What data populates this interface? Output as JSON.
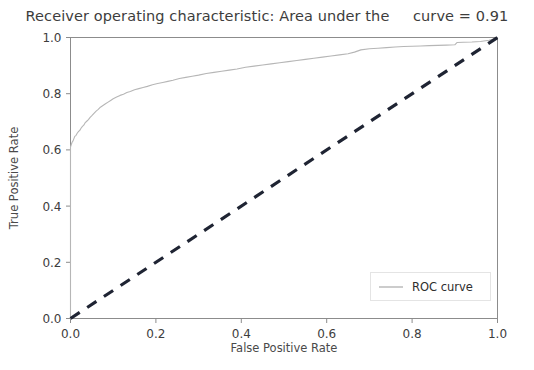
{
  "chart_data": {
    "type": "line",
    "title": "Receiver operating characteristic: Area under the     curve = 0.91",
    "title_main": "Receiver operating characteristic: Area under the",
    "title_auc_text": "curve = 0.91",
    "auc": 0.91,
    "xlabel": "False Positive Rate",
    "ylabel": "True Positive Rate",
    "xlim": [
      0.0,
      1.0
    ],
    "ylim": [
      0.0,
      1.0
    ],
    "grid": false,
    "legend_position": "lower right",
    "xticks": [
      "0.0",
      "0.2",
      "0.4",
      "0.6",
      "0.8",
      "1.0"
    ],
    "xtick_values": [
      0.0,
      0.2,
      0.4,
      0.6,
      0.8,
      1.0
    ],
    "yticks": [
      "0.0",
      "0.2",
      "0.4",
      "0.6",
      "0.8",
      "1.0"
    ],
    "ytick_values": [
      0.0,
      0.2,
      0.4,
      0.6,
      0.8,
      1.0
    ],
    "series": [
      {
        "name": "ROC curve",
        "style": "solid",
        "color": "#b6b6b6",
        "linewidth": 1.1,
        "x": [
          0.0,
          0.0,
          0.002,
          0.004,
          0.006,
          0.008,
          0.01,
          0.013,
          0.016,
          0.019,
          0.022,
          0.025,
          0.028,
          0.031,
          0.034,
          0.038,
          0.042,
          0.046,
          0.05,
          0.055,
          0.06,
          0.065,
          0.07,
          0.076,
          0.082,
          0.088,
          0.094,
          0.1,
          0.108,
          0.116,
          0.124,
          0.132,
          0.14,
          0.15,
          0.16,
          0.17,
          0.18,
          0.192,
          0.204,
          0.216,
          0.228,
          0.24,
          0.255,
          0.27,
          0.285,
          0.3,
          0.318,
          0.336,
          0.354,
          0.372,
          0.39,
          0.41,
          0.43,
          0.45,
          0.47,
          0.49,
          0.51,
          0.53,
          0.55,
          0.57,
          0.59,
          0.61,
          0.63,
          0.65,
          0.665,
          0.68,
          0.7,
          0.72,
          0.74,
          0.76,
          0.78,
          0.8,
          0.82,
          0.84,
          0.86,
          0.88,
          0.9,
          0.905,
          0.92,
          0.94,
          0.96,
          0.98,
          0.992,
          1.0
        ],
        "y": [
          0.0,
          0.61,
          0.62,
          0.628,
          0.632,
          0.64,
          0.648,
          0.652,
          0.66,
          0.666,
          0.67,
          0.678,
          0.684,
          0.688,
          0.696,
          0.702,
          0.708,
          0.716,
          0.722,
          0.73,
          0.738,
          0.744,
          0.752,
          0.758,
          0.764,
          0.77,
          0.776,
          0.782,
          0.788,
          0.794,
          0.798,
          0.804,
          0.808,
          0.814,
          0.818,
          0.822,
          0.826,
          0.832,
          0.836,
          0.84,
          0.844,
          0.848,
          0.854,
          0.858,
          0.862,
          0.866,
          0.872,
          0.876,
          0.88,
          0.884,
          0.888,
          0.894,
          0.898,
          0.902,
          0.906,
          0.91,
          0.914,
          0.918,
          0.922,
          0.926,
          0.93,
          0.934,
          0.938,
          0.942,
          0.948,
          0.956,
          0.96,
          0.962,
          0.964,
          0.966,
          0.968,
          0.969,
          0.97,
          0.971,
          0.972,
          0.973,
          0.974,
          0.982,
          0.983,
          0.984,
          0.986,
          0.99,
          0.995,
          1.0
        ]
      },
      {
        "name": "chance-diagonal",
        "style": "dashed",
        "color": "#1f2433",
        "linewidth": 3.2,
        "x": [
          0.0,
          1.0
        ],
        "y": [
          0.0,
          1.0
        ]
      }
    ],
    "legend": [
      {
        "label": "ROC curve",
        "color": "#b6b6b6",
        "style": "solid"
      }
    ]
  }
}
